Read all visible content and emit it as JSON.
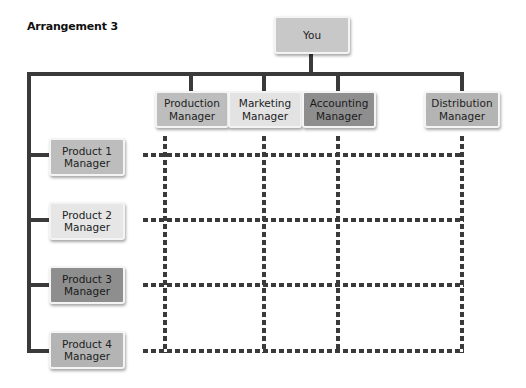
{
  "title": "Arrangement 3",
  "top": {
    "label": "You",
    "color": "#c8c8c8"
  },
  "managers": [
    {
      "label": "Production\nManager",
      "color": "#bdbdbd"
    },
    {
      "label": "Marketing\nManager",
      "color": "#e3e3e3"
    },
    {
      "label": "Accounting\nManager",
      "color": "#8e8e8e"
    },
    {
      "label": "Distribution\nManager",
      "color": "#b4b4b4"
    }
  ],
  "products": [
    {
      "label": "Product 1\nManager",
      "color": "#bdbdbd"
    },
    {
      "label": "Product 2\nManager",
      "color": "#e6e6e6"
    },
    {
      "label": "Product 3\nManager",
      "color": "#8e8e8e"
    },
    {
      "label": "Product 4\nManager",
      "color": "#b4b4b4"
    }
  ],
  "colors": {
    "line": "#3a3a3a",
    "background": "#ffffff"
  }
}
